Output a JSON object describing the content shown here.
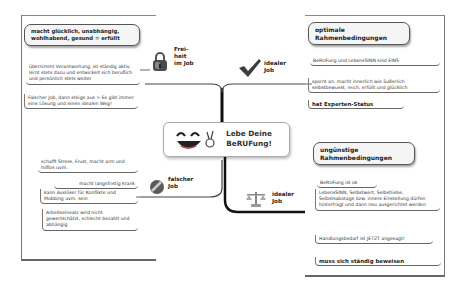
{
  "central_topic": {
    "line1": "Lebe Deine",
    "line2": "BeRUFung!",
    "icon": "laughing-smiley-icon"
  },
  "branches": {
    "freiheit": {
      "label_line1": "Frei-",
      "label_line2": "heit",
      "label_line3": "im Job",
      "icon": "padlock-icon",
      "header_line1": "macht glücklich, unabhängig,",
      "header_line2": "wohlhabend, gesund = erfüllt",
      "items": [
        "übernimmt Verantwortung, ist ständig aktiv, lernt stets dazu und entwickelt sich beruflich und persönlich stets weiter",
        "Falscher Job, dann steige aus > Es gibt immer eine Lösung und einen idealen Weg!"
      ]
    },
    "idealer_job_optimal": {
      "label_line1": "idealer",
      "label_line2": "Job",
      "icon": "checkmark-icon",
      "header_line1": "optimale",
      "header_line2": "Rahmenbedingungen",
      "items": [
        "BeRUFung und LebensSINN sind EINS",
        "spornt an, macht innerlich wie äußerlich selbstbewusst, reich, erfüllt und glücklich",
        "hat Experten-Status"
      ]
    },
    "falscher_job": {
      "label_line1": "falscher",
      "label_line2": "Job",
      "icon": "no-entry-icon",
      "items": [
        "schafft Stress, Frust, macht arm und hilflos uvm.",
        "macht langsfristig krank",
        "kann Auslöser für Konflikte und Mobbing uvm. sein",
        "Arbeitseinsatz wird nicht gewertschätzt, schlecht bezahlt und abhängig"
      ]
    },
    "idealer_job_unguenstig": {
      "label_line1": "idealer",
      "label_line2": "Job",
      "icon": "scales-icon",
      "header_line1": "ungünstige",
      "header_line2": "Rahmenbedingungen",
      "items": [
        "BeRUFung ist ok",
        "LebensSINN, Selbstwert, Selbstliebe, Selbstsabotage bzw. innere Einstellung dürfen hinterfragt und dann neu ausgerichtet werden",
        "Handlungsbedarf ist JETZT angesagt!",
        "muss sich ständig beweisen"
      ]
    }
  },
  "colors": {
    "line": "#111111",
    "border": "#555555",
    "header_bg": "#f5f5f5"
  }
}
